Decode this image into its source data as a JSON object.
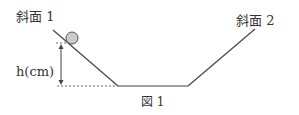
{
  "labels": {
    "slope1": "斜面 1",
    "slope2": "斜面 2",
    "height": "h(cm)",
    "figure": "図 1"
  },
  "colors": {
    "line": "#444444",
    "ball_fill": "#cccccc",
    "ball_stroke": "#555555",
    "text": "#333333"
  }
}
